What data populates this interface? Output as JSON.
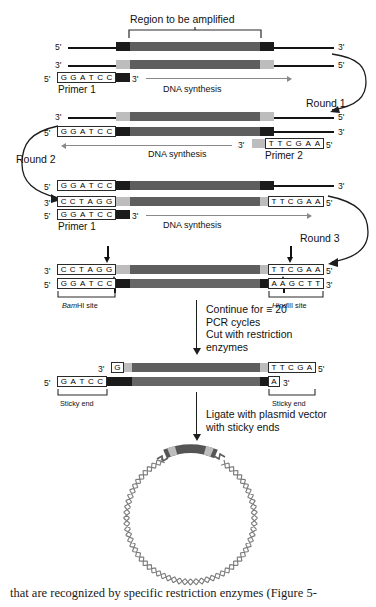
{
  "figure": {
    "title": "Region to be amplified",
    "caption": "that are recognized by specific restriction enzymes (Figure 5-"
  },
  "labels": {
    "five_prime": "5'",
    "three_prime": "3'",
    "dna_synthesis": "DNA synthesis",
    "primer1": "Primer 1",
    "primer2": "Primer 2",
    "round1": "Round 1",
    "round2": "Round 2",
    "round3": "Round 3",
    "bamhi_italic": "Bam",
    "bamhi_rest": "HI site",
    "hindiii_italic": "Hind",
    "hindiii_rest": "III site",
    "sticky_end": "Sticky end"
  },
  "steps": {
    "cut": "Continue for ≡ 20\nPCR cycles\nCut with restriction\nenzymes",
    "ligate": "Ligate with plasmid vector\nwith sticky ends"
  },
  "sequences": {
    "ggatcc": [
      "G",
      "G",
      "A",
      "T",
      "C",
      "C"
    ],
    "cctagg": [
      "C",
      "C",
      "T",
      "A",
      "G",
      "G"
    ],
    "ttcgaa": [
      "T",
      "T",
      "C",
      "G",
      "A",
      "A"
    ],
    "aagctt": [
      "A",
      "A",
      "G",
      "C",
      "T",
      "T"
    ],
    "ttcga": [
      "T",
      "T",
      "C",
      "G",
      "A"
    ],
    "gatcc": [
      "G",
      "A",
      "T",
      "C",
      "C"
    ],
    "g": [
      "G"
    ],
    "a": [
      "A"
    ]
  },
  "colors": {
    "strand_dark": "#1b1b1b",
    "strand_mid": "#5e5e5e",
    "strand_light": "#bdbdbd",
    "synthesis_arrow": "#8a8a8a",
    "plasmid": "#7a7a7a"
  },
  "panels": {
    "p1_round": "Round 1",
    "p2_round": "Round 2",
    "p3_round": "Round 3"
  }
}
